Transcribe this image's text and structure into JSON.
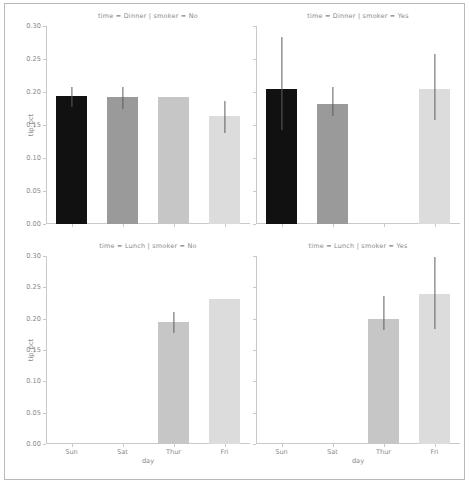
{
  "chart_data": {
    "type": "bar",
    "title": "",
    "subtitle": "",
    "xlabel": "day",
    "ylabel": "tip_pct",
    "ylim": [
      0.0,
      0.3
    ],
    "yticks": [
      "0.00",
      "0.05",
      "0.10",
      "0.15",
      "0.20",
      "0.25",
      "0.30"
    ],
    "ytick_values": [
      0.0,
      0.05,
      0.1,
      0.15,
      0.2,
      0.25,
      0.3
    ],
    "categories": [
      "Sun",
      "Sat",
      "Thur",
      "Fri"
    ],
    "grid": false,
    "legend": "none",
    "facet_rows": [
      "Dinner",
      "Lunch"
    ],
    "facet_cols": [
      "No",
      "Yes"
    ],
    "bar_colors": [
      "#111111",
      "#9a9a9a",
      "#c6c6c6",
      "#dcdcdc"
    ],
    "error_bar_color": "#5d5d5d",
    "panels": [
      {
        "title": "time = Dinner | smoker = No",
        "row": 0,
        "col": 0,
        "values": [
          0.194,
          0.192,
          0.192,
          0.163
        ],
        "err_low": [
          0.178,
          0.174,
          null,
          0.138
        ],
        "err_high": [
          0.208,
          0.207,
          null,
          0.186
        ]
      },
      {
        "title": "time = Dinner | smoker = Yes",
        "row": 0,
        "col": 1,
        "values": [
          0.205,
          0.182,
          null,
          0.204
        ],
        "err_low": [
          0.142,
          0.163,
          null,
          0.158
        ],
        "err_high": [
          0.283,
          0.207,
          null,
          0.257
        ]
      },
      {
        "title": "time = Lunch | smoker = No",
        "row": 1,
        "col": 0,
        "values": [
          null,
          null,
          0.194,
          0.231
        ],
        "err_low": [
          null,
          null,
          0.177,
          null
        ],
        "err_high": [
          null,
          null,
          0.211,
          null
        ]
      },
      {
        "title": "time = Lunch | smoker = Yes",
        "row": 1,
        "col": 1,
        "values": [
          null,
          null,
          0.2,
          0.24
        ],
        "err_low": [
          null,
          null,
          0.182,
          0.183
        ],
        "err_high": [
          null,
          null,
          0.236,
          0.299
        ]
      }
    ]
  }
}
